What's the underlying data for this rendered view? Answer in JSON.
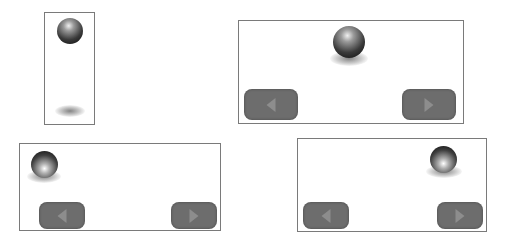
{
  "figure": {
    "panels": [
      {
        "id": "panel-1",
        "description": "narrow frame, ball at top, shadow at bottom",
        "has_buttons": false
      },
      {
        "id": "panel-2",
        "description": "ball centered with shadow below",
        "has_buttons": true,
        "buttons": [
          {
            "label": "",
            "icon": "arrow-left-icon"
          },
          {
            "label": "",
            "icon": "arrow-right-icon"
          }
        ]
      },
      {
        "id": "panel-3",
        "description": "ball at top-left",
        "has_buttons": true,
        "buttons": [
          {
            "label": "",
            "icon": "arrow-left-icon"
          },
          {
            "label": "",
            "icon": "arrow-right-icon"
          }
        ]
      },
      {
        "id": "panel-4",
        "description": "ball at top-right",
        "has_buttons": true,
        "buttons": [
          {
            "label": "",
            "icon": "arrow-left-icon"
          },
          {
            "label": "",
            "icon": "arrow-right-icon"
          }
        ]
      }
    ],
    "colors": {
      "frame_border": "#7a7a7a",
      "button_fill": "#6d6d6d",
      "button_arrow": "#8d8d8d",
      "background": "#ffffff"
    }
  }
}
